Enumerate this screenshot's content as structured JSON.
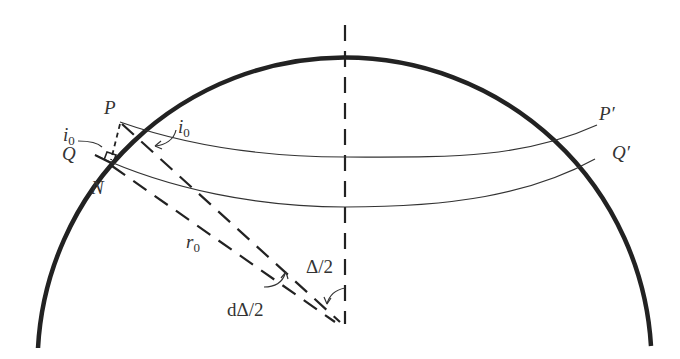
{
  "diagram": {
    "type": "geometry",
    "colors": {
      "stroke": "#222222",
      "text": "#333333",
      "background": "#ffffff"
    },
    "circle": {
      "cx": 345,
      "cy": 330,
      "r": 307
    },
    "points": {
      "P": {
        "label": "P",
        "x": 120,
        "y": 122
      },
      "Q": {
        "label": "Q",
        "x": 95,
        "y": 155
      },
      "N": {
        "label": "N",
        "x": 112,
        "y": 163
      },
      "P_prime": {
        "label": "P′",
        "x": 597,
        "y": 125
      },
      "Q_prime": {
        "label": "Q′",
        "x": 609,
        "y": 159
      },
      "center": {
        "x": 345,
        "y": 324
      }
    },
    "labels": {
      "P": "P",
      "Q": "Q",
      "N": "N",
      "P_prime": "P′",
      "Q_prime": "Q′",
      "i0_left_base": "i",
      "i0_left_sub": "0",
      "i0_right_base": "i",
      "i0_right_sub": "0",
      "r0_base": "r",
      "r0_sub": "0",
      "half_delta": "Δ/2",
      "d_half_delta": "dΔ/2"
    }
  }
}
